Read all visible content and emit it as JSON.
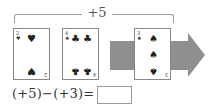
{
  "bracket": {
    "label": "+5"
  },
  "cards": [
    {
      "rank": "2",
      "suit": "heart",
      "pips": [
        "♥",
        "♥"
      ]
    },
    {
      "rank": "4",
      "suit": "club",
      "pips": [
        "♣",
        "♣",
        "♣",
        "♣"
      ]
    },
    {
      "rank": "3",
      "suit": "spade",
      "pips": [
        "♠",
        "♠",
        "♠"
      ]
    }
  ],
  "equation": {
    "text": "(+5)−(+3)=",
    "answer": ""
  },
  "colors": {
    "arrow": "#8f8f8f"
  }
}
